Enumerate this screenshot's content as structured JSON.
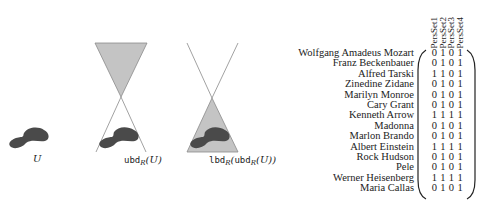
{
  "figure": {
    "panels": [
      {
        "id": "U",
        "label_main": "U",
        "label_sub": "",
        "label_arg": ""
      },
      {
        "id": "ubd",
        "label_op": "ubd",
        "label_sub": "R",
        "label_arg": "(U)"
      },
      {
        "id": "lbd",
        "label_op": "lbd",
        "label_sub": "R",
        "label_arg_open": "(",
        "label_inner_op": "ubd",
        "label_inner_sub": "R",
        "label_inner_arg": "(U))"
      }
    ],
    "colors": {
      "blob": "#4a4a4a",
      "cone_fill": "#c4c4c4",
      "cone_line": "#8a8a8a",
      "text": "#222222"
    }
  },
  "matrix": {
    "columns": [
      "PersSet1",
      "PersSet2",
      "PersSet3",
      "PersSet4"
    ],
    "rows": [
      {
        "name": "Wolfgang Amadeus Mozart",
        "values": [
          "0",
          "1",
          "0",
          "1"
        ]
      },
      {
        "name": "Franz Beckenbauer",
        "values": [
          "0",
          "1",
          "0",
          "1"
        ]
      },
      {
        "name": "Alfred Tarski",
        "values": [
          "1",
          "1",
          "0",
          "1"
        ]
      },
      {
        "name": "Zinedine Zidane",
        "values": [
          "0",
          "1",
          "0",
          "1"
        ]
      },
      {
        "name": "Marilyn Monroe",
        "values": [
          "0",
          "1",
          "0",
          "1"
        ]
      },
      {
        "name": "Cary Grant",
        "values": [
          "0",
          "1",
          "0",
          "1"
        ]
      },
      {
        "name": "Kenneth Arrow",
        "values": [
          "1",
          "1",
          "1",
          "1"
        ]
      },
      {
        "name": "Madonna",
        "values": [
          "0",
          "1",
          "0",
          "1"
        ]
      },
      {
        "name": "Marlon Brando",
        "values": [
          "0",
          "1",
          "0",
          "1"
        ]
      },
      {
        "name": "Albert Einstein",
        "values": [
          "1",
          "1",
          "1",
          "1"
        ]
      },
      {
        "name": "Rock Hudson",
        "values": [
          "0",
          "1",
          "0",
          "1"
        ]
      },
      {
        "name": "Pele",
        "values": [
          "0",
          "1",
          "0",
          "1"
        ]
      },
      {
        "name": "Werner Heisenberg",
        "values": [
          "1",
          "1",
          "1",
          "1"
        ]
      },
      {
        "name": "Maria Callas",
        "values": [
          "0",
          "1",
          "0",
          "1"
        ]
      }
    ]
  }
}
